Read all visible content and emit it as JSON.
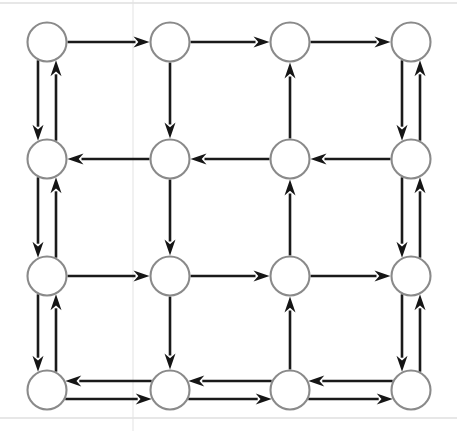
{
  "figure": {
    "background_color": "#ffffff",
    "node_stroke_color": "#8a8a8a",
    "edge_color": "#1a1a1a",
    "arrowhead_color": "#151515"
  },
  "geometry": {
    "width": 457,
    "height": 431,
    "node_radius": 19.5,
    "columns_x": [
      47,
      170,
      290,
      411
    ],
    "rows_y": [
      42,
      159,
      276,
      390
    ],
    "parallel_offset": 9,
    "arrow_head_length": 16,
    "arrow_head_width": 11
  },
  "nodes": [
    {
      "id": "n11",
      "label": "",
      "row": 0,
      "col": 0
    },
    {
      "id": "n12",
      "label": "",
      "row": 0,
      "col": 1
    },
    {
      "id": "n13",
      "label": "",
      "row": 0,
      "col": 2
    },
    {
      "id": "n14",
      "label": "",
      "row": 0,
      "col": 3
    },
    {
      "id": "n21",
      "label": "",
      "row": 1,
      "col": 0
    },
    {
      "id": "n22",
      "label": "",
      "row": 1,
      "col": 1
    },
    {
      "id": "n23",
      "label": "",
      "row": 1,
      "col": 2
    },
    {
      "id": "n24",
      "label": "",
      "row": 1,
      "col": 3
    },
    {
      "id": "n31",
      "label": "",
      "row": 2,
      "col": 0
    },
    {
      "id": "n32",
      "label": "",
      "row": 2,
      "col": 1
    },
    {
      "id": "n33",
      "label": "",
      "row": 2,
      "col": 2
    },
    {
      "id": "n34",
      "label": "",
      "row": 2,
      "col": 3
    },
    {
      "id": "n41",
      "label": "",
      "row": 3,
      "col": 0
    },
    {
      "id": "n42",
      "label": "",
      "row": 3,
      "col": 1
    },
    {
      "id": "n43",
      "label": "",
      "row": 3,
      "col": 2
    },
    {
      "id": "n44",
      "label": "",
      "row": 3,
      "col": 3
    }
  ],
  "edges": [
    {
      "id": "e-r0-c0-c1",
      "orientation": "horizontal",
      "row": 0,
      "from_col": 0,
      "to_col": 1,
      "direction": "right",
      "offset": 0
    },
    {
      "id": "e-r0-c1-c2",
      "orientation": "horizontal",
      "row": 0,
      "from_col": 1,
      "to_col": 2,
      "direction": "right",
      "offset": 0
    },
    {
      "id": "e-r0-c2-c3",
      "orientation": "horizontal",
      "row": 0,
      "from_col": 2,
      "to_col": 3,
      "direction": "right",
      "offset": 0
    },
    {
      "id": "e-r1-c1-c0",
      "orientation": "horizontal",
      "row": 1,
      "from_col": 1,
      "to_col": 0,
      "direction": "left",
      "offset": 0
    },
    {
      "id": "e-r1-c2-c1",
      "orientation": "horizontal",
      "row": 1,
      "from_col": 2,
      "to_col": 1,
      "direction": "left",
      "offset": 0
    },
    {
      "id": "e-r1-c3-c2",
      "orientation": "horizontal",
      "row": 1,
      "from_col": 3,
      "to_col": 2,
      "direction": "left",
      "offset": 0
    },
    {
      "id": "e-r2-c0-c1",
      "orientation": "horizontal",
      "row": 2,
      "from_col": 0,
      "to_col": 1,
      "direction": "right",
      "offset": 0
    },
    {
      "id": "e-r2-c1-c2",
      "orientation": "horizontal",
      "row": 2,
      "from_col": 1,
      "to_col": 2,
      "direction": "right",
      "offset": 0
    },
    {
      "id": "e-r2-c2-c3",
      "orientation": "horizontal",
      "row": 2,
      "from_col": 2,
      "to_col": 3,
      "direction": "right",
      "offset": 0
    },
    {
      "id": "e-r3-c1-c0",
      "orientation": "horizontal",
      "row": 3,
      "from_col": 1,
      "to_col": 0,
      "direction": "left",
      "offset": -9
    },
    {
      "id": "e-r3-c0-c1",
      "orientation": "horizontal",
      "row": 3,
      "from_col": 0,
      "to_col": 1,
      "direction": "right",
      "offset": 9
    },
    {
      "id": "e-r3-c2-c1",
      "orientation": "horizontal",
      "row": 3,
      "from_col": 2,
      "to_col": 1,
      "direction": "left",
      "offset": -9
    },
    {
      "id": "e-r3-c1-c2",
      "orientation": "horizontal",
      "row": 3,
      "from_col": 1,
      "to_col": 2,
      "direction": "right",
      "offset": 9
    },
    {
      "id": "e-r3-c3-c2",
      "orientation": "horizontal",
      "row": 3,
      "from_col": 3,
      "to_col": 2,
      "direction": "left",
      "offset": -9
    },
    {
      "id": "e-r3-c2-c3",
      "orientation": "horizontal",
      "row": 3,
      "from_col": 2,
      "to_col": 3,
      "direction": "right",
      "offset": 9
    },
    {
      "id": "e-c0-r0-r1",
      "orientation": "vertical",
      "col": 0,
      "from_row": 0,
      "to_row": 1,
      "direction": "down",
      "offset": -9
    },
    {
      "id": "e-c0-r1-r0",
      "orientation": "vertical",
      "col": 0,
      "from_row": 1,
      "to_row": 0,
      "direction": "up",
      "offset": 9
    },
    {
      "id": "e-c0-r1-r2",
      "orientation": "vertical",
      "col": 0,
      "from_row": 1,
      "to_row": 2,
      "direction": "down",
      "offset": -9
    },
    {
      "id": "e-c0-r2-r1",
      "orientation": "vertical",
      "col": 0,
      "from_row": 2,
      "to_row": 1,
      "direction": "up",
      "offset": 9
    },
    {
      "id": "e-c0-r2-r3",
      "orientation": "vertical",
      "col": 0,
      "from_row": 2,
      "to_row": 3,
      "direction": "down",
      "offset": -9
    },
    {
      "id": "e-c0-r3-r2",
      "orientation": "vertical",
      "col": 0,
      "from_row": 3,
      "to_row": 2,
      "direction": "up",
      "offset": 9
    },
    {
      "id": "e-c1-r0-r1",
      "orientation": "vertical",
      "col": 1,
      "from_row": 0,
      "to_row": 1,
      "direction": "down",
      "offset": 0
    },
    {
      "id": "e-c1-r1-r2",
      "orientation": "vertical",
      "col": 1,
      "from_row": 1,
      "to_row": 2,
      "direction": "down",
      "offset": 0
    },
    {
      "id": "e-c1-r2-r3",
      "orientation": "vertical",
      "col": 1,
      "from_row": 2,
      "to_row": 3,
      "direction": "down",
      "offset": 0
    },
    {
      "id": "e-c2-r1-r0",
      "orientation": "vertical",
      "col": 2,
      "from_row": 1,
      "to_row": 0,
      "direction": "up",
      "offset": 0
    },
    {
      "id": "e-c2-r2-r1",
      "orientation": "vertical",
      "col": 2,
      "from_row": 2,
      "to_row": 1,
      "direction": "up",
      "offset": 0
    },
    {
      "id": "e-c2-r3-r2",
      "orientation": "vertical",
      "col": 2,
      "from_row": 3,
      "to_row": 2,
      "direction": "up",
      "offset": 0
    },
    {
      "id": "e-c3-r0-r1",
      "orientation": "vertical",
      "col": 3,
      "from_row": 0,
      "to_row": 1,
      "direction": "down",
      "offset": -9
    },
    {
      "id": "e-c3-r1-r0",
      "orientation": "vertical",
      "col": 3,
      "from_row": 1,
      "to_row": 0,
      "direction": "up",
      "offset": 9
    },
    {
      "id": "e-c3-r1-r2",
      "orientation": "vertical",
      "col": 3,
      "from_row": 1,
      "to_row": 2,
      "direction": "down",
      "offset": -9
    },
    {
      "id": "e-c3-r2-r1",
      "orientation": "vertical",
      "col": 3,
      "from_row": 2,
      "to_row": 1,
      "direction": "up",
      "offset": 9
    },
    {
      "id": "e-c3-r2-r3",
      "orientation": "vertical",
      "col": 3,
      "from_row": 2,
      "to_row": 3,
      "direction": "down",
      "offset": -9
    },
    {
      "id": "e-c3-r3-r2",
      "orientation": "vertical",
      "col": 3,
      "from_row": 3,
      "to_row": 2,
      "direction": "up",
      "offset": 9
    }
  ],
  "scan_artifacts": [
    {
      "id": "rule-top",
      "orientation": "horizontal",
      "position": 3,
      "faint": false
    },
    {
      "id": "rule-bottom",
      "orientation": "horizontal",
      "position": 418,
      "faint": false
    },
    {
      "id": "rule-vertical-seam",
      "orientation": "vertical",
      "position": 133,
      "faint": true
    }
  ]
}
